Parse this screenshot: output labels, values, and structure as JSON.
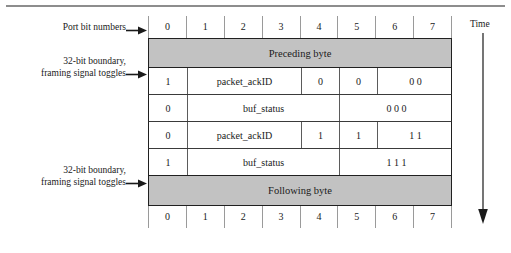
{
  "figure": {
    "port_bit_numbers_label": "Port bit numbers",
    "boundary_label_line1": "32-bit boundary,",
    "boundary_label_line2": "framing signal toggles",
    "time_label": "Time"
  },
  "columns": {
    "header_top": [
      "0",
      "1",
      "2",
      "3",
      "4",
      "5",
      "6",
      "7"
    ],
    "header_bottom": [
      "0",
      "1",
      "2",
      "3",
      "4",
      "5",
      "6",
      "7"
    ]
  },
  "rows": [
    {
      "kind": "shaded",
      "label": "Preceding byte"
    },
    {
      "kind": "data",
      "cells": [
        {
          "text": "1",
          "span": 1
        },
        {
          "text": "packet_ackID",
          "span": 3
        },
        {
          "text": "0",
          "span": 1
        },
        {
          "text": "0",
          "span": 1
        },
        {
          "text": "0 0",
          "span": 2
        }
      ]
    },
    {
      "kind": "data",
      "cells": [
        {
          "text": "0",
          "span": 1
        },
        {
          "text": "buf_status",
          "span": 4
        },
        {
          "text": "0 0 0",
          "span": 3
        }
      ]
    },
    {
      "kind": "data",
      "cells": [
        {
          "text": "0",
          "span": 1
        },
        {
          "text": "packet_ackID",
          "span": 3
        },
        {
          "text": "1",
          "span": 1
        },
        {
          "text": "1",
          "span": 1
        },
        {
          "text": "1 1",
          "span": 2
        }
      ]
    },
    {
      "kind": "data",
      "cells": [
        {
          "text": "1",
          "span": 1
        },
        {
          "text": "buf_status",
          "span": 4
        },
        {
          "text": "1 1 1",
          "span": 3
        }
      ]
    },
    {
      "kind": "shaded",
      "label": "Following byte"
    }
  ],
  "colors": {
    "shaded_fill": "#c2c2c2",
    "border": "#202020",
    "grid_line": "#5b5b5b",
    "text": "#1a1a1a"
  }
}
